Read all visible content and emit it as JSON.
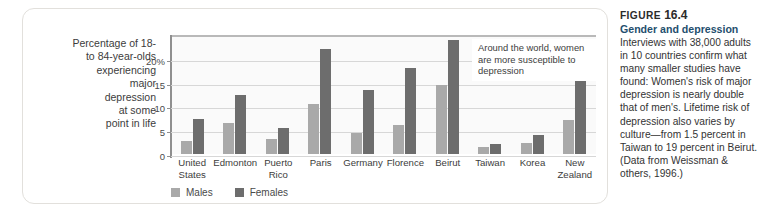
{
  "chart_data": {
    "type": "bar",
    "title": "",
    "xlabel": "",
    "ylabel": "Percentage of 18- to 84-year-olds experiencing major depression at some point in life",
    "ylim": [
      0,
      25
    ],
    "yticks": [
      "0",
      "5",
      "10",
      "15",
      "20%"
    ],
    "ytick_values": [
      0,
      5,
      10,
      15,
      20
    ],
    "grid": true,
    "legend_position": "bottom-left",
    "categories": [
      "United States",
      "Edmonton",
      "Puerto Rico",
      "Paris",
      "Germany",
      "Florence",
      "Beirut",
      "Taiwan",
      "Korea",
      "New Zealand"
    ],
    "series": [
      {
        "name": "Males",
        "color": "#a9a9a9",
        "values": [
          2.8,
          6.5,
          3.1,
          10.5,
          4.5,
          6.2,
          14.5,
          1.4,
          2.3,
          7.2
        ]
      },
      {
        "name": "Females",
        "color": "#6d6d6d",
        "values": [
          7.4,
          12.5,
          5.4,
          22.0,
          13.5,
          18.0,
          24.0,
          2.0,
          3.9,
          15.3
        ]
      }
    ],
    "annotations": [
      {
        "text": "Around the world, women are more susceptible to depression"
      }
    ]
  },
  "axis_caption": {
    "lines": [
      "Percentage of 18-",
      "to 84-year-olds",
      "experiencing",
      "major",
      "depression",
      "at some",
      "point in life"
    ]
  },
  "legend": {
    "items": [
      {
        "label": "Males",
        "swatch": "males"
      },
      {
        "label": "Females",
        "swatch": "females"
      }
    ]
  },
  "callout": {
    "text": "Around the world, women are more susceptible to depression"
  },
  "caption": {
    "figure_word": "FIGURE",
    "figure_number": "16.4",
    "title": "Gender and depression",
    "body": "Interviews with 38,000 adults in 10 countries confirm what many smaller studies have found: Women's risk of major depression is nearly double that of men's. Lifetime risk of depression also varies by culture—from 1.5 percent in Taiwan to 19 percent in Beirut. (Data from Weissman & others, 1996.)"
  },
  "colors": {
    "males": "#a9a9a9",
    "females": "#6d6d6d",
    "grid": "#d7d7d7",
    "plot_bg": "#fafafa",
    "panel_border": "#e2e0dc",
    "caption_title": "#1f4f6e"
  }
}
